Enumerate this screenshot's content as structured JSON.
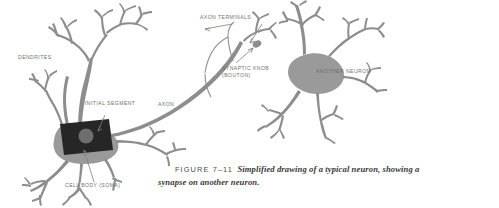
{
  "figure": {
    "type": "anatomical-illustration",
    "background_color": "#ffffff",
    "ink_color": "#8d8d8d",
    "soma_color": "#262626",
    "nucleus_color": "#6e6e6e",
    "label_color": "#6f6f6f",
    "caption_color": "#3a3a3a"
  },
  "labels": {
    "dendrites": "DENDRITES",
    "initial_segment": "INITIAL SEGMENT",
    "cell_body": "CELL BODY (SOMA)",
    "axon": "AXON",
    "axon_terminals": "AXON TERMINALS",
    "synaptic_knob_line1": "SYNAPTIC KNOB",
    "synaptic_knob_line2": "(BOUTON)",
    "another_neuron": "ANOTHER NEURON"
  },
  "caption": {
    "figure_number": "FIGURE 7–11",
    "line1": "Simplified drawing of a typical neuron, showing a",
    "line2": "synapse on another neuron."
  }
}
